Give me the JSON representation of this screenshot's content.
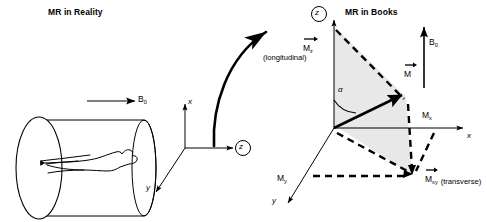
{
  "figure": {
    "type": "diagram",
    "width": 487,
    "height": 222,
    "background": "#ffffff",
    "stroke": "#000000",
    "shade_fill": "#e8e8e8"
  },
  "panels": {
    "left": {
      "title": "MR in Reality",
      "field_label": "B",
      "field_sub": "0",
      "axes": {
        "x_label": "x",
        "y_label": "y",
        "z_label": "z",
        "z_circled": true
      },
      "scanner": {
        "shape": "cylinder",
        "contains": "patient-outline"
      }
    },
    "right": {
      "title": "MR in Books",
      "field_label": "B",
      "field_sub": "0",
      "axes": {
        "x_label": "x",
        "y_label": "y",
        "z_label": "z",
        "z_circled": true
      },
      "vectors": {
        "m": {
          "symbol": "M",
          "sub": "",
          "note": ""
        },
        "mz": {
          "symbol": "M",
          "sub": "z",
          "note": "(longitudinal)"
        },
        "mxy": {
          "symbol": "M",
          "sub": "xy",
          "note": "(transverse)"
        },
        "mx": {
          "symbol": "M",
          "sub": "x"
        },
        "my": {
          "symbol": "M",
          "sub": "y"
        }
      },
      "angle_label": "α"
    }
  },
  "connector": {
    "name": "curved-transition-arrow",
    "from": "reality-z-axis",
    "to": "books-z-axis"
  }
}
